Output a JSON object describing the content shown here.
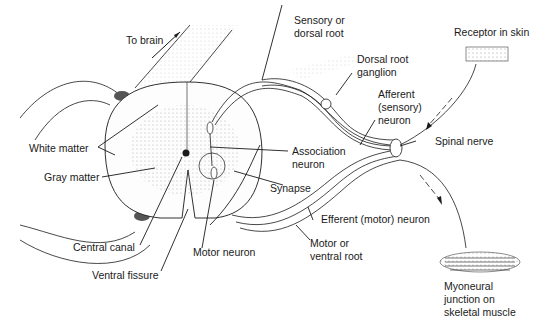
{
  "diagram": {
    "colors": {
      "line": "#1a1a1a",
      "stipple": "#9a9a9a",
      "background": "#ffffff"
    },
    "labels": {
      "to_brain": "To brain",
      "sensory_root_1": "Sensory or",
      "sensory_root_2": "dorsal root",
      "receptor": "Receptor in skin",
      "drg_1": "Dorsal root",
      "drg_2": "ganglion",
      "afferent_1": "Afferent",
      "afferent_2": "(sensory)",
      "afferent_3": "neuron",
      "white_matter": "White matter",
      "association_1": "Association",
      "association_2": "neuron",
      "spinal_nerve": "Spinal nerve",
      "gray_matter": "Gray matter",
      "synapse": "Synapse",
      "efferent": "Efferent (motor) neuron",
      "central_canal": "Central canal",
      "motor_neuron": "Motor neuron",
      "motor_root_1": "Motor or",
      "motor_root_2": "ventral root",
      "ventral_fissure": "Ventral fissure",
      "myoneural_1": "Myoneural",
      "myoneural_2": "junction on",
      "myoneural_3": "skeletal muscle"
    }
  }
}
